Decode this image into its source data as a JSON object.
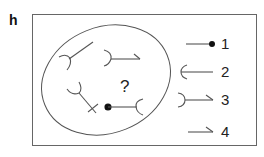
{
  "panel": {
    "label": "h"
  },
  "diagram": {
    "question_mark": "?",
    "colors": {
      "stroke": "#555555",
      "frame": "#666666",
      "text": "#222222",
      "dot": "#111111"
    },
    "ellipse_symbols": [
      {
        "id": "cup-with-diagonal",
        "description": "left-opening cup with diagonal line up-right"
      },
      {
        "id": "cup-with-hooked-line",
        "description": "right-curved cup with horizontal line ending in hook"
      },
      {
        "id": "cup-with-crossed-line",
        "description": "cup with diagonal line down-right ending in cross"
      },
      {
        "id": "dot-line-cup",
        "description": "dot with line ending in left-opening cup"
      }
    ],
    "legend": [
      {
        "number": "1",
        "description": "line ending in dot"
      },
      {
        "number": "2",
        "description": "left-opening cup with line"
      },
      {
        "number": "3",
        "description": "right-curved cup with line ending in hook"
      },
      {
        "number": "4",
        "description": "line ending in hook"
      }
    ]
  }
}
